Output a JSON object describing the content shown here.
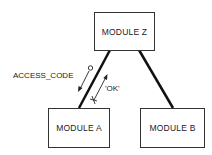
{
  "diagram": {
    "modules": {
      "z": {
        "label": "MODULE Z"
      },
      "a": {
        "label": "MODULE A"
      },
      "b": {
        "label": "MODULE B"
      }
    },
    "connections": [
      {
        "from": "MODULE Z",
        "to": "MODULE A"
      },
      {
        "from": "MODULE Z",
        "to": "MODULE B"
      }
    ],
    "couples": [
      {
        "label": "ACCESS_CODE",
        "direction": "Z to A",
        "tail": "open-circle"
      },
      {
        "label": "'OK'",
        "direction": "A to Z",
        "tail": "cross"
      }
    ],
    "colors": {
      "line": "#111111",
      "box_border": "#333333",
      "text": "#222222"
    }
  }
}
